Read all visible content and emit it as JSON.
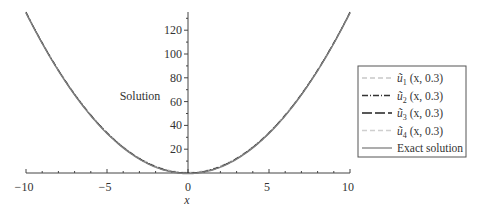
{
  "chart_data": {
    "type": "line",
    "title": "",
    "xlabel": "x",
    "ylabel": "Solution",
    "xlim": [
      -10,
      10
    ],
    "ylim": [
      0,
      135
    ],
    "xticks": [
      -10,
      -5,
      0,
      5,
      10
    ],
    "xtick_labels": [
      "−10",
      "−5",
      "0",
      "5",
      "10"
    ],
    "yticks": [
      20,
      40,
      60,
      80,
      100,
      120
    ],
    "ytick_labels": [
      "20",
      "40",
      "60",
      "80",
      "100",
      "120"
    ],
    "grid": false,
    "legend_position": "right",
    "series": [
      {
        "name": "ũ₁ (x, 0.3)",
        "style": "dashed",
        "color": "#c8c8c8",
        "x": [
          -10,
          -5,
          0,
          5,
          10
        ],
        "y": [
          135,
          33.75,
          0,
          33.75,
          135
        ]
      },
      {
        "name": "ũ₂ (x, 0.3)",
        "style": "dashdot",
        "color": "#333333",
        "x": [
          -10,
          -5,
          0,
          5,
          10
        ],
        "y": [
          135,
          33.75,
          0,
          33.75,
          135
        ]
      },
      {
        "name": "ũ₃ (x, 0.3)",
        "style": "longdash",
        "color": "#222222",
        "x": [
          -10,
          -5,
          0,
          5,
          10
        ],
        "y": [
          135,
          33.75,
          0,
          33.75,
          135
        ]
      },
      {
        "name": "ũ₄ (x, 0.3)",
        "style": "dashed",
        "color": "#cfcfcf",
        "x": [
          -10,
          -5,
          0,
          5,
          10
        ],
        "y": [
          135,
          33.75,
          0,
          33.75,
          135
        ]
      },
      {
        "name": "Exact solution",
        "style": "solid",
        "color": "#808080",
        "x": [
          -10,
          -5,
          0,
          5,
          10
        ],
        "y": [
          135,
          33.75,
          0,
          33.75,
          135
        ]
      }
    ]
  },
  "axes": {
    "x_label": "x",
    "y_label": "Solution"
  },
  "legend": {
    "items": [
      {
        "label_sym": "u",
        "sub": "1",
        "args": " (x, 0.3)"
      },
      {
        "label_sym": "u",
        "sub": "2",
        "args": " (x, 0.3)"
      },
      {
        "label_sym": "u",
        "sub": "3",
        "args": " (x, 0.3)"
      },
      {
        "label_sym": "u",
        "sub": "4",
        "args": " (x, 0.3)"
      },
      {
        "label": "Exact solution"
      }
    ]
  }
}
